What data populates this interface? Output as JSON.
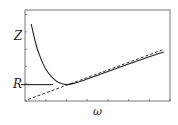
{
  "chart_data": {
    "type": "line",
    "title": "",
    "xlabel": "ω",
    "ylabel": "Z",
    "y_marked_levels": [
      {
        "label": "R",
        "value": 1.0
      }
    ],
    "grid": false,
    "legend": null,
    "xlim": [
      0,
      7
    ],
    "ylim": [
      0,
      5
    ],
    "x_ticks_count": 7,
    "y_ticks_count": 6,
    "series": [
      {
        "name": "Z(ω)",
        "style": "solid",
        "x": [
          0.3,
          0.5,
          0.7,
          1.0,
          1.3,
          1.6,
          2.0,
          2.5,
          3.0,
          4.0,
          5.0,
          6.0,
          6.7
        ],
        "values": [
          4.7,
          3.6,
          2.8,
          1.95,
          1.45,
          1.15,
          1.0,
          1.13,
          1.34,
          1.8,
          2.25,
          2.7,
          3.0
        ]
      },
      {
        "name": "asymptote",
        "style": "dashed",
        "x": [
          0.15,
          6.7
        ],
        "values": [
          0.1,
          3.15
        ]
      },
      {
        "name": "R level",
        "style": "solid",
        "x": [
          0,
          1.35
        ],
        "values": [
          1.0,
          1.0
        ]
      }
    ]
  }
}
